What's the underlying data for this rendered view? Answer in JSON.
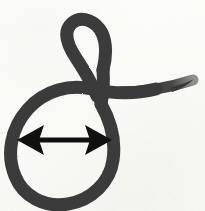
{
  "figure": {
    "title": "Handwritten loop glyph with width annotation",
    "medium": "ink on paper",
    "canvas": {
      "width": 205,
      "height": 211
    },
    "background_color": "#fdfdfb",
    "paper_tint": "#f8f8f5"
  },
  "ink": {
    "color": "#3b3b3b",
    "color_dark": "#2f2f2f",
    "stroke_width": 13,
    "tail_taper_width": 3,
    "description": "single continuous cursive stroke forming a small upper loop, a large teardrop lower loop, and a tapering horizontal tail to the right"
  },
  "strokes": [
    {
      "name": "upper-loop",
      "label": "small upper loop",
      "path": "M 97 96 C 92 84 84 70 76 58 C 68 46 62 32 72 23 C 82 15 96 21 102 33 C 107 44 106 58 103 70",
      "width": 13
    },
    {
      "name": "loop-descent",
      "label": "descending connector through crossing point",
      "path": "M 103 70 C 104 82 103 94 101 104",
      "width": 13
    },
    {
      "name": "lower-loop",
      "label": "large teardrop loop",
      "path": "M 101 104 C 110 120 116 140 113 160 C 110 182 92 200 68 204 C 44 208 23 196 15 176 C 6 154 11 128 28 109 C 45 90 70 84 92 89 C 114 94 136 94 156 89",
      "width": 13
    },
    {
      "name": "tail-stroke",
      "label": "tapering horizontal tail to the right",
      "path": "M 120 92 C 142 92 168 88 193 80",
      "width_start": 12,
      "width_end": 2
    }
  ],
  "annotation": {
    "name": "width-dimension-arrow",
    "label": "double-headed width arrow across the large loop",
    "color": "#101010",
    "orientation": "horizontal",
    "double_headed": true,
    "shaft": {
      "x1": 36,
      "y1": 140,
      "x2": 94,
      "y2": 140,
      "thickness": 5
    },
    "left_head": {
      "tip_x": 17,
      "tip_y": 140,
      "base_x": 44,
      "half_height": 15
    },
    "right_head": {
      "tip_x": 112,
      "tip_y": 140,
      "base_x": 85,
      "half_height": 15
    },
    "measured_extent_px": 95
  }
}
